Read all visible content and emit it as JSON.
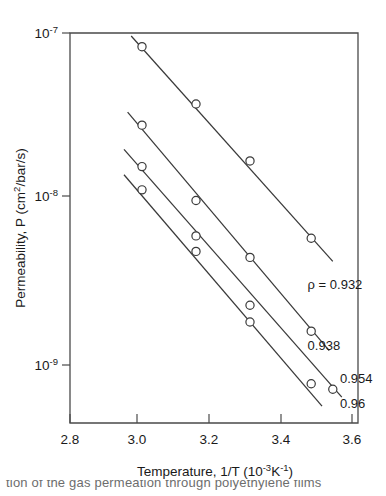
{
  "figure": {
    "background": "#ffffff",
    "ink_color": "#3a3a3a",
    "caption_fragment": "tion of the gas permeation through polyethylene films"
  },
  "chart_data": {
    "type": "line",
    "title": "",
    "subtitle": "",
    "xlabel_parts": {
      "main": "Temperature, 1/T  (10",
      "exp1": "-3",
      "mid": "K",
      "exp2": "-1",
      "tail": ")"
    },
    "xlabel": "Temperature, 1/T (10^-3 K^-1)",
    "ylabel_parts": {
      "main": "Permeability,  P  (cm",
      "exp": "2",
      "tail": "/bar/s)"
    },
    "ylabel": "Permeability, P (cm^2/bar/s)",
    "xlim": [
      2.8,
      3.6
    ],
    "ylim": [
      1e-10,
      1e-07
    ],
    "xticks": [
      2.8,
      3.0,
      3.2,
      3.4,
      3.6
    ],
    "xtick_labels": [
      "2.8",
      "3.0",
      "3.2",
      "3.4",
      "3.6"
    ],
    "yticks": [
      1e-07,
      1e-08,
      1e-09
    ],
    "ytick_labels": [
      {
        "mantissa": "10",
        "exponent": "-7"
      },
      {
        "mantissa": "10",
        "exponent": "-8"
      },
      {
        "mantissa": "10",
        "exponent": "-9"
      }
    ],
    "yscale": "log",
    "grid": false,
    "legend_position": "inline-right-of-curve-ends",
    "series": [
      {
        "name": "rho = 0.932",
        "label_text": "ρ = 0.932",
        "label_x": 3.46,
        "label_y": 3.05e-09,
        "density": 0.932,
        "x": [
          3.0,
          3.15,
          3.3,
          3.47
        ],
        "y": [
          8.3e-08,
          3.8e-08,
          1.75e-08,
          6.1e-09
        ],
        "line_x": [
          2.97,
          3.53
        ],
        "line_y": [
          9.6e-08,
          4.45e-09
        ]
      },
      {
        "name": "rho = 0.938",
        "label_text": "0.938",
        "label_x": 3.46,
        "label_y": 1.33e-09,
        "density": 0.938,
        "x": [
          3.0,
          3.15,
          3.3,
          3.47
        ],
        "y": [
          2.85e-08,
          1.02e-08,
          4.7e-09,
          1.72e-09
        ],
        "line_x": [
          2.96,
          3.52
        ],
        "line_y": [
          3.4e-08,
          1.32e-09
        ]
      },
      {
        "name": "rho = 0.954",
        "label_text": "0.954",
        "label_x": 3.55,
        "label_y": 8.5e-10,
        "density": 0.954,
        "x": [
          3.0,
          3.15,
          3.3,
          3.53
        ],
        "y": [
          1.62e-08,
          6.3e-09,
          2.45e-09,
          7.8e-10
        ],
        "line_x": [
          2.95,
          3.555
        ],
        "line_y": [
          2.05e-08,
          7e-10
        ]
      },
      {
        "name": "rho = 0.96",
        "label_text": "0.96",
        "label_x": 3.55,
        "label_y": 6e-10,
        "density": 0.96,
        "x": [
          3.0,
          3.15,
          3.3,
          3.47
        ],
        "y": [
          1.18e-08,
          5.1e-09,
          1.95e-09,
          8.4e-10
        ],
        "line_x": [
          2.95,
          3.5
        ],
        "line_y": [
          1.45e-08,
          6.2e-10
        ]
      }
    ]
  }
}
